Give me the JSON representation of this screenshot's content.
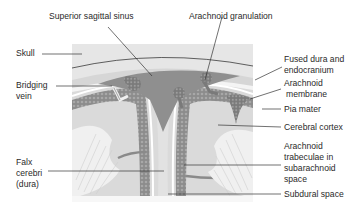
{
  "diagram": {
    "colors": {
      "skull": "#e6e6e6",
      "dura": "#d4d4d4",
      "sinus": "#8f8f8f",
      "granulation": "#7e7e7e",
      "arachnoid_texture": "#9a9a9a",
      "cortex": "#d8d8d8",
      "white_matter": "#efefef",
      "subdural_space": "#ffffff",
      "leader_line": "#333333",
      "label_text": "#2a2a2a"
    },
    "labels": {
      "superior_sagittal_sinus": "Superior sagittal sinus",
      "arachnoid_granulation": "Arachnoid granulation",
      "skull": "Skull",
      "bridging_vein_1": "Bridging",
      "bridging_vein_2": "vein",
      "fused_dura_1": "Fused dura and",
      "fused_dura_2": "endocranium",
      "arachnoid_membrane_1": "Arachnoid",
      "arachnoid_membrane_2": "membrane",
      "pia_mater": "Pia mater",
      "cerebral_cortex": "Cerebral cortex",
      "falx_1": "Falx",
      "falx_2": "cerebri",
      "falx_3": "(dura)",
      "trabeculae_1": "Arachnoid",
      "trabeculae_2": "trabeculae in",
      "trabeculae_3": "subarachnoid",
      "trabeculae_4": "space",
      "subdural_space": "Subdural space"
    }
  }
}
